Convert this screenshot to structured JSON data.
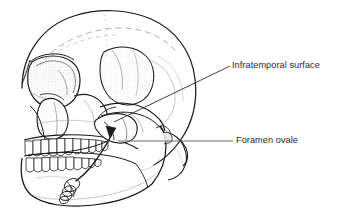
{
  "figure": {
    "type": "anatomical-illustration",
    "background_color": "#ffffff",
    "line_color": "#1a1a1a",
    "text_color": "#2b2b2b",
    "width": 338,
    "height": 220
  },
  "labels": [
    {
      "id": "infratemporal",
      "text": "Infratemporal surface",
      "leader": "diagonal",
      "target_region": "greater wing of sphenoid / infratemporal fossa"
    },
    {
      "id": "foramen_ovale",
      "text": "Foramen ovale",
      "leader": "horizontal",
      "target_region": "foramen ovale at base of sphenoid"
    }
  ],
  "leader_lines": [
    {
      "name": "infratemporal-leader",
      "x1": 114,
      "y1": 122,
      "x2": 230,
      "y2": 66,
      "color": "#2b2b2b"
    },
    {
      "name": "foramen-ovale-leader",
      "x1": 118,
      "y1": 141,
      "x2": 233,
      "y2": 141,
      "color": "#555555"
    }
  ],
  "anatomy_parts": [
    "frontal bone",
    "parietal bone",
    "temporal line",
    "orbit",
    "nasal aperture",
    "zygomatic bone",
    "zygomatic arch",
    "greater wing of sphenoid",
    "maxilla with upper teeth",
    "mandible with lower teeth",
    "mandibular ramus",
    "mastoid process",
    "pterygoid plates",
    "coiled nerve structure"
  ]
}
